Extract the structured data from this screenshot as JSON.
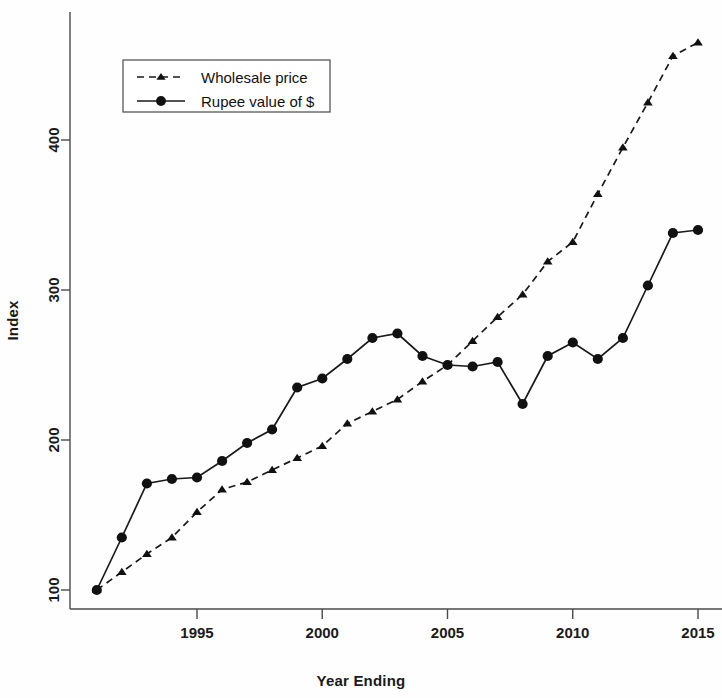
{
  "chart_data": {
    "type": "line",
    "title": "",
    "xlabel": "Year Ending",
    "ylabel": "Index",
    "xlim": [
      1991,
      2015
    ],
    "ylim": [
      95,
      470
    ],
    "xticks": [
      1995,
      2000,
      2005,
      2010,
      2015
    ],
    "yticks": [
      100,
      200,
      300,
      400
    ],
    "grid": false,
    "legend_position": "top-left",
    "x": [
      1991,
      1992,
      1993,
      1994,
      1995,
      1996,
      1997,
      1998,
      1999,
      2000,
      2001,
      2002,
      2003,
      2004,
      2005,
      2006,
      2007,
      2008,
      2009,
      2010,
      2011,
      2012,
      2013,
      2014,
      2015
    ],
    "series": [
      {
        "name": "Wholesale price",
        "marker": "triangle",
        "linestyle": "dashed",
        "values": [
          100,
          112,
          124,
          135,
          152,
          167,
          172,
          180,
          188,
          196,
          211,
          219,
          227,
          239,
          250,
          266,
          282,
          297,
          319,
          332,
          364,
          395,
          425,
          456,
          465
        ]
      },
      {
        "name": "Rupee value of $",
        "marker": "circle",
        "linestyle": "solid",
        "values": [
          100,
          135,
          171,
          174,
          175,
          186,
          198,
          207,
          235,
          241,
          254,
          268,
          271,
          256,
          250,
          249,
          252,
          224,
          256,
          265,
          254,
          268,
          303,
          338,
          340
        ]
      }
    ]
  },
  "legend": {
    "entries": [
      {
        "label": "Wholesale price"
      },
      {
        "label": "Rupee value of $"
      }
    ]
  },
  "axes": {
    "x_title": "Year Ending",
    "y_title": "Index",
    "x_tick_labels": [
      "1995",
      "2000",
      "2005",
      "2010",
      "2015"
    ],
    "y_tick_labels": [
      "100",
      "200",
      "300",
      "400"
    ]
  },
  "colors": {
    "line": "#1a1a1a",
    "axis": "#4a4a4a",
    "background": "#fefefe"
  }
}
